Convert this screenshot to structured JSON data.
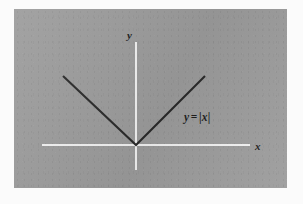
{
  "figure": {
    "type": "math-graph",
    "title": "",
    "panel": {
      "background_color": "#9c9c9c",
      "outer_background_color": "#fbfbfb"
    },
    "axes": {
      "color": "#f2f2f2",
      "x_label": "x",
      "y_label": "y",
      "origin_visible": true,
      "ticks": [],
      "tick_labels": []
    },
    "annotations": {
      "equation": {
        "full_text": "y = |x|",
        "lhs": "y",
        "operator": "=",
        "open_bar": "|",
        "argument": "x",
        "close_bar": "|",
        "color": "#1d1d1d"
      }
    },
    "curve": {
      "name": "absolute-value-curve",
      "color": "#2a2a2a",
      "stroke_width": 2.1,
      "vertex": {
        "x": 122,
        "y": 136
      },
      "left_endpoint": {
        "x": 49,
        "y": 67
      },
      "right_endpoint": {
        "x": 191,
        "y": 67
      }
    }
  },
  "chart_data": {
    "type": "line",
    "xlabel": "x",
    "ylabel": "y",
    "grid": false,
    "legend": "none",
    "annotations": [
      "y = |x|"
    ],
    "x": [
      -1,
      0,
      1
    ],
    "series": [
      {
        "name": "y = |x|",
        "values": [
          1,
          0,
          1
        ]
      }
    ],
    "xlim": [
      -1.3,
      1.55
    ],
    "ylim": [
      -0.35,
      1.45
    ],
    "xticks": [],
    "yticks": []
  }
}
